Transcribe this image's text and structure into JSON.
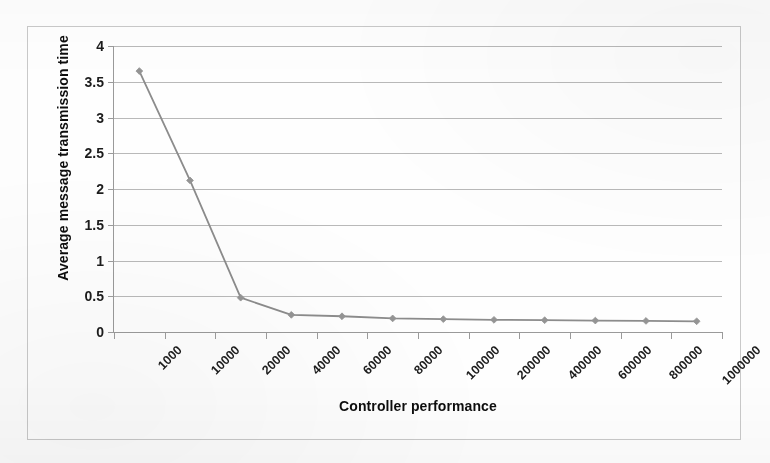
{
  "figure": {
    "background_color": "#fdfdfd",
    "frame_color": "#c9c9c9"
  },
  "chart_data": {
    "type": "line",
    "title": "",
    "xlabel": "Controller performance",
    "ylabel": "Average message transmission time",
    "categories": [
      "1000",
      "10000",
      "20000",
      "40000",
      "60000",
      "80000",
      "100000",
      "200000",
      "400000",
      "600000",
      "800000",
      "1000000"
    ],
    "values": [
      3.65,
      2.12,
      0.48,
      0.24,
      0.22,
      0.19,
      0.18,
      0.17,
      0.165,
      0.16,
      0.155,
      0.15
    ],
    "series": [
      {
        "name": "Average message transmission time",
        "values": [
          3.65,
          2.12,
          0.48,
          0.24,
          0.22,
          0.19,
          0.18,
          0.17,
          0.165,
          0.16,
          0.155,
          0.15
        ]
      }
    ],
    "ylim": [
      0,
      4
    ],
    "y_ticks": [
      "0",
      "0.5",
      "1",
      "1.5",
      "2",
      "2.5",
      "3",
      "3.5",
      "4"
    ],
    "y_tick_values": [
      0,
      0.5,
      1,
      1.5,
      2,
      2.5,
      3,
      3.5,
      4
    ],
    "grid": true,
    "grid_axis": "y",
    "legend": false,
    "legend_position": "none",
    "marker": "diamond",
    "line_color": "#8c8c8c",
    "marker_color": "#949494",
    "gridline_color": "#b9b9b9",
    "axis_color": "#9a9a9a",
    "x_tick_label_rotation": -45
  }
}
